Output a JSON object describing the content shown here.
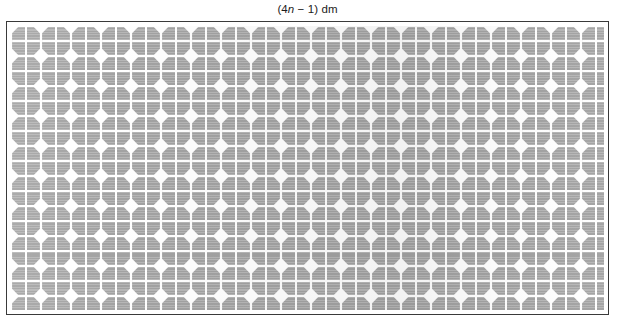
{
  "figure": {
    "name": "solar-panel-diagram",
    "caption": {
      "prefix": "(4",
      "variable": "n",
      "suffix": " − 1) dm",
      "full_text": "(4n − 1) dm",
      "expression": "4n - 1",
      "unit": "dm",
      "describes": "width-of-panel"
    },
    "panel": {
      "label": "solar-panel",
      "frame_border_color": "#3a3a3a",
      "frame_background": "#ffffff",
      "cell_color": "#a8a8a8",
      "gap_color": "#ffffff",
      "columns": 20,
      "rows": 10,
      "cell_pitch_px": 30,
      "cell_shape": "octagon",
      "cell_subdivisions": 4,
      "total_cells": 200
    }
  },
  "chart_data": {
    "type": "diagram",
    "title": "(4n − 1) dm",
    "subtitle": "",
    "annotations": [
      {
        "text": "(4n − 1) dm",
        "position": "top-center",
        "measures": "width"
      }
    ],
    "grid": {
      "columns": 20,
      "rows": 10
    },
    "xlabel": "(4n − 1) dm",
    "ylabel": ""
  }
}
